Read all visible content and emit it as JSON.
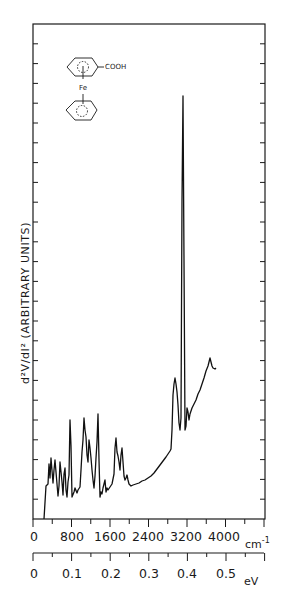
{
  "chart_data": {
    "type": "line",
    "title": "",
    "ylabel": "d²V/dI² (ARBITRARY UNITS)",
    "xlabel_primary": "cm⁻¹",
    "xlabel_secondary": "eV",
    "x_ticks_primary": [
      "0",
      "800",
      "1600",
      "2400",
      "3200",
      "4000"
    ],
    "x_ticks_secondary": [
      "0",
      "0.1",
      "0.2",
      "0.3",
      "0.4",
      "0.5"
    ],
    "xlim_cm": [
      0,
      4800
    ],
    "xlim_eV": [
      0,
      0.6
    ],
    "y_ticks_count": 24,
    "grid": false,
    "legend": null,
    "annotation": {
      "type": "molecule-structure",
      "name": "ferrocenecarboxylic acid",
      "labels": {
        "substituent": "COOH",
        "metal": "Fe"
      }
    },
    "series": [
      {
        "name": "IETS spectrum",
        "x_cm": [
          230,
          270,
          330,
          400,
          460,
          540,
          600,
          660,
          720,
          770,
          800,
          840,
          880,
          930,
          980,
          1030,
          1070,
          1100,
          1150,
          1200,
          1240,
          1290,
          1330,
          1360,
          1440,
          1490,
          1520,
          1560,
          1600,
          1650,
          1700,
          1760,
          1800,
          2000,
          2200,
          2400,
          2600,
          2750,
          2800,
          2840,
          2860,
          2900,
          2950,
          3000,
          3050,
          3080,
          3100,
          3130,
          3180,
          3250,
          3350,
          3500,
          3600,
          3680,
          3750,
          3820
        ],
        "y_rel": [
          0,
          7,
          11,
          12,
          8,
          13,
          6,
          12,
          5,
          20,
          5,
          6,
          8,
          16,
          21,
          17,
          12,
          16,
          12,
          8,
          22,
          5,
          6,
          8,
          16,
          13,
          10,
          15,
          8,
          9,
          7,
          7,
          6,
          8,
          11,
          14,
          18,
          20,
          28,
          30,
          31,
          25,
          18,
          20,
          86,
          20,
          18,
          21,
          23,
          25,
          28,
          31,
          33,
          34,
          31,
          31
        ]
      }
    ]
  },
  "figure": {
    "ylabel": "d²V/dI² (ARBITRARY UNITS)",
    "unit_cm": "cm",
    "unit_cm_exp": "-1",
    "unit_ev": "eV",
    "mol_cooh": "COOH",
    "mol_fe": "Fe"
  }
}
